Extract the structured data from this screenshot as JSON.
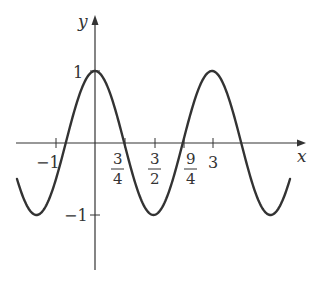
{
  "chart_data": {
    "type": "line",
    "title": "",
    "function": "y = cos(2πx/3)",
    "xlabel": "x",
    "ylabel": "y",
    "xlim": [
      -2.0,
      5.0
    ],
    "ylim": [
      -1.0,
      1.0
    ],
    "grid": false,
    "legend": null,
    "x_ticks": [
      {
        "value": -1,
        "label": "−1"
      },
      {
        "value": 0.75,
        "label_num": "3",
        "label_den": "4"
      },
      {
        "value": 1.5,
        "label_num": "3",
        "label_den": "2"
      },
      {
        "value": 2.25,
        "label_num": "9",
        "label_den": "4"
      },
      {
        "value": 3,
        "label": "3"
      }
    ],
    "y_ticks": [
      {
        "value": 1,
        "label": "1"
      },
      {
        "value": -1,
        "label": "−1"
      }
    ],
    "series": [
      {
        "name": "cos(2πx/3)",
        "x": [
          -2.0,
          -1.5,
          -0.75,
          0,
          0.75,
          1.5,
          2.25,
          3.0,
          3.75,
          4.5,
          5.0
        ],
        "values": [
          -0.5,
          -1,
          0,
          1,
          0,
          -1,
          0,
          1,
          0,
          -1,
          -0.5
        ]
      }
    ]
  },
  "axes": {
    "x_label": "x",
    "y_label": "y",
    "tick_x_neg1": "−1",
    "tick_x_3": "3",
    "frac_34_num": "3",
    "frac_34_den": "4",
    "frac_32_num": "3",
    "frac_32_den": "2",
    "frac_94_num": "9",
    "frac_94_den": "4",
    "tick_y_1": "1",
    "tick_y_neg1": "−1"
  }
}
